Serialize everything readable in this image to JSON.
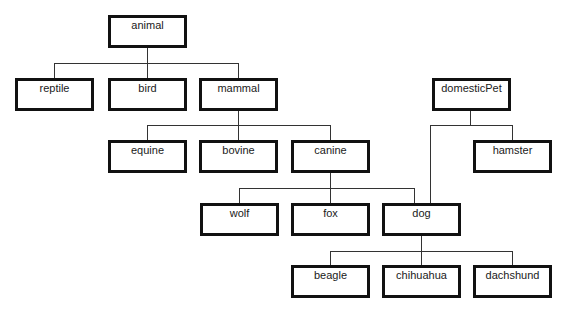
{
  "diagram": {
    "type": "class-hierarchy-tree",
    "colors": {
      "border": "#111111",
      "line": "#333333",
      "background": "#ffffff",
      "text": "#1a1a1a"
    },
    "nodes": [
      {
        "id": "animal",
        "label": "animal",
        "x": 108,
        "y": 15
      },
      {
        "id": "reptile",
        "label": "reptile",
        "x": 15,
        "y": 78
      },
      {
        "id": "bird",
        "label": "bird",
        "x": 108,
        "y": 78
      },
      {
        "id": "mammal",
        "label": "mammal",
        "x": 199,
        "y": 78
      },
      {
        "id": "domesticPet",
        "label": "domesticPet",
        "x": 432,
        "y": 78
      },
      {
        "id": "equine",
        "label": "equine",
        "x": 108,
        "y": 140
      },
      {
        "id": "bovine",
        "label": "bovine",
        "x": 199,
        "y": 140
      },
      {
        "id": "canine",
        "label": "canine",
        "x": 291,
        "y": 140
      },
      {
        "id": "hamster",
        "label": "hamster",
        "x": 473,
        "y": 140
      },
      {
        "id": "wolf",
        "label": "wolf",
        "x": 200,
        "y": 203
      },
      {
        "id": "fox",
        "label": "fox",
        "x": 291,
        "y": 203
      },
      {
        "id": "dog",
        "label": "dog",
        "x": 382,
        "y": 203
      },
      {
        "id": "beagle",
        "label": "beagle",
        "x": 291,
        "y": 265
      },
      {
        "id": "chihuahua",
        "label": "chihuahua",
        "x": 382,
        "y": 265
      },
      {
        "id": "dachshund",
        "label": "dachshund",
        "x": 473,
        "y": 265
      }
    ],
    "edges": [
      {
        "from": "animal",
        "to": "reptile"
      },
      {
        "from": "animal",
        "to": "bird"
      },
      {
        "from": "animal",
        "to": "mammal"
      },
      {
        "from": "mammal",
        "to": "equine"
      },
      {
        "from": "mammal",
        "to": "bovine"
      },
      {
        "from": "mammal",
        "to": "canine"
      },
      {
        "from": "domesticPet",
        "to": "hamster"
      },
      {
        "from": "domesticPet",
        "to": "dog"
      },
      {
        "from": "canine",
        "to": "wolf"
      },
      {
        "from": "canine",
        "to": "fox"
      },
      {
        "from": "canine",
        "to": "dog"
      },
      {
        "from": "dog",
        "to": "beagle"
      },
      {
        "from": "dog",
        "to": "chihuahua"
      },
      {
        "from": "dog",
        "to": "dachshund"
      }
    ]
  }
}
